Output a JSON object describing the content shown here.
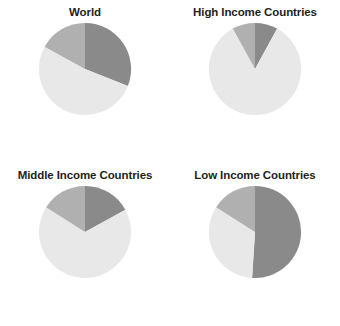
{
  "figure": {
    "name": "four-panel-pie-chart-figure",
    "background": "#ffffff"
  },
  "palette": {
    "dark": "#8a8a8a",
    "medium": "#b0b0b0",
    "light": "#e8e8e8"
  },
  "chart_data": [
    {
      "type": "pie",
      "title": "World",
      "labels": [
        "Dark segment",
        "Light segment",
        "Medium segment"
      ],
      "values": [
        31,
        52,
        17
      ],
      "colors": [
        "#8a8a8a",
        "#e8e8e8",
        "#b0b0b0"
      ],
      "start_angle": 0,
      "direction": "clockwise",
      "legend": "none",
      "grid": false
    },
    {
      "type": "pie",
      "title": "High Income Countries",
      "labels": [
        "Dark segment",
        "Light segment",
        "Medium segment"
      ],
      "values": [
        8,
        84,
        8
      ],
      "colors": [
        "#8a8a8a",
        "#e8e8e8",
        "#b0b0b0"
      ],
      "start_angle": 0,
      "direction": "clockwise",
      "legend": "none",
      "grid": false
    },
    {
      "type": "pie",
      "title": "Middle Income Countries",
      "labels": [
        "Dark segment",
        "Light segment",
        "Medium segment"
      ],
      "values": [
        17,
        67,
        16
      ],
      "colors": [
        "#8a8a8a",
        "#e8e8e8",
        "#b0b0b0"
      ],
      "start_angle": 0,
      "direction": "clockwise",
      "legend": "none",
      "grid": false
    },
    {
      "type": "pie",
      "title": "Low Income Countries",
      "labels": [
        "Dark segment",
        "Light segment",
        "Medium segment"
      ],
      "values": [
        51,
        33,
        16
      ],
      "colors": [
        "#8a8a8a",
        "#e8e8e8",
        "#b0b0b0"
      ],
      "start_angle": 0,
      "direction": "clockwise",
      "legend": "none",
      "grid": false
    }
  ]
}
